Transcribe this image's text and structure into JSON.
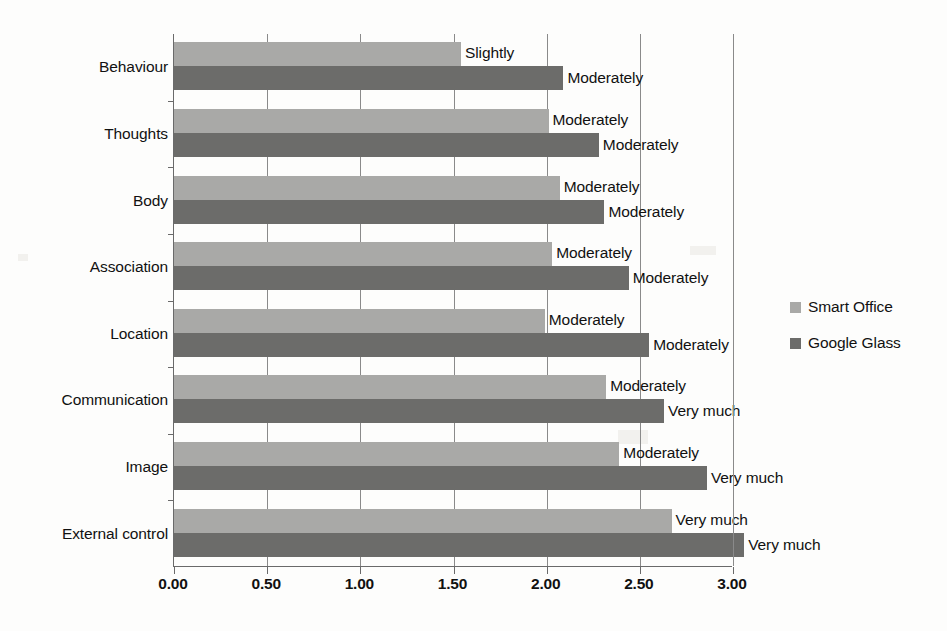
{
  "chart_data": {
    "type": "bar",
    "orientation": "horizontal",
    "title": "",
    "xlabel": "",
    "ylabel": "",
    "xlim": [
      0.0,
      3.0
    ],
    "xticks": [
      "0.00",
      "0.50",
      "1.00",
      "1.50",
      "2.00",
      "2.50",
      "3.00"
    ],
    "xtick_values": [
      0.0,
      0.5,
      1.0,
      1.5,
      2.0,
      2.5,
      3.0
    ],
    "grid": true,
    "legend_position": "right",
    "categories": [
      "Behaviour",
      "Thoughts",
      "Body",
      "Association",
      "Location",
      "Communication",
      "Image",
      "External control"
    ],
    "series": [
      {
        "name": "Smart Office",
        "color": "#a9a9a7",
        "values": [
          1.54,
          2.01,
          2.07,
          2.03,
          1.99,
          2.32,
          2.39,
          2.67
        ],
        "point_labels": [
          "Slightly",
          "Moderately",
          "Moderately",
          "Moderately",
          "Moderately",
          "Moderately",
          "Moderately",
          "Very much"
        ]
      },
      {
        "name": "Google Glass",
        "color": "#6c6c6a",
        "values": [
          2.09,
          2.28,
          2.31,
          2.44,
          2.55,
          2.63,
          2.86,
          3.06
        ],
        "point_labels": [
          "Moderately",
          "Moderately",
          "Moderately",
          "Moderately",
          "Moderately",
          "Very much",
          "Very much",
          "Very much"
        ]
      }
    ]
  },
  "legend": {
    "items": [
      {
        "label": "Smart Office",
        "color": "#a9a9a7"
      },
      {
        "label": "Google Glass",
        "color": "#6c6c6a"
      }
    ]
  }
}
